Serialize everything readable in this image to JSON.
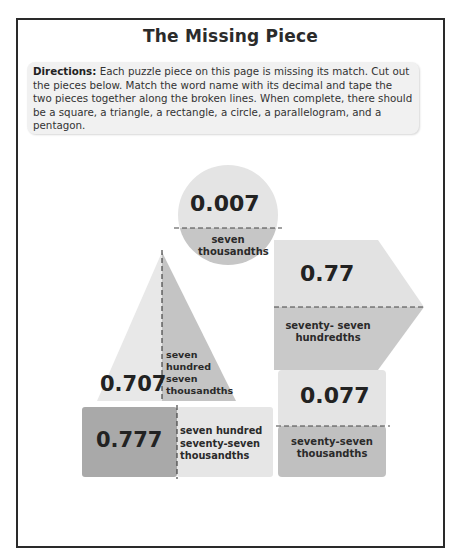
{
  "title": "The Missing Piece",
  "directions": {
    "label": "Directions:",
    "text": "Each puzzle piece on this page is missing its match. Cut out the pieces below. Match the word name with its decimal and tape the two pieces together along the broken lines. When complete, there should be a square, a triangle, a rectangle, a circle, a parallelogram, and a pentagon."
  },
  "pieces": [
    {
      "shape": "circle",
      "decimal": "0.007",
      "words": "seven thousandths",
      "words_lines": [
        "seven",
        "thousandths"
      ]
    },
    {
      "shape": "pentagon",
      "decimal": "0.77",
      "words": "seventy- seven hundredths",
      "words_lines": [
        "seventy- seven",
        "hundredths"
      ]
    },
    {
      "shape": "triangle",
      "decimal": "0.707",
      "words": "seven hundred seven thousandths",
      "words_lines": [
        "seven",
        "hundred",
        "seven",
        "thousandths"
      ]
    },
    {
      "shape": "rectangle",
      "decimal": "0.777",
      "words": "seven hundred seventy-seven thousandths",
      "words_lines": [
        "seven hundred",
        "seventy-seven",
        "thousandths"
      ]
    },
    {
      "shape": "square",
      "decimal": "0.077",
      "words": "seventy-seven thousandths",
      "words_lines": [
        "seventy-seven",
        "thousandths"
      ]
    }
  ],
  "colors": {
    "light_gray": "#e6e6e6",
    "mid_gray": "#c9c9c9",
    "dark_gray": "#a8a8a8",
    "border": "#2a2a2a"
  }
}
